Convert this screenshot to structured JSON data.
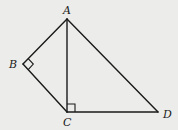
{
  "diagram": {
    "points": {
      "A": {
        "label": "A",
        "x": 67,
        "y": 19
      },
      "B": {
        "label": "B",
        "x": 23,
        "y": 64
      },
      "C": {
        "label": "C",
        "x": 67,
        "y": 112
      },
      "D": {
        "label": "D",
        "x": 158,
        "y": 112
      }
    },
    "segments": [
      [
        "A",
        "B"
      ],
      [
        "B",
        "C"
      ],
      [
        "A",
        "C"
      ],
      [
        "A",
        "D"
      ],
      [
        "C",
        "D"
      ]
    ],
    "right_angles": [
      "B",
      "C"
    ],
    "colors": {
      "background": "#ececea",
      "stroke": "#1a1a1a"
    }
  }
}
